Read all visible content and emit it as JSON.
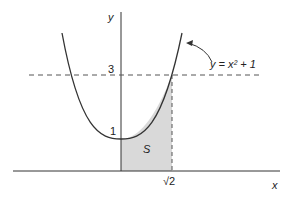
{
  "figure": {
    "curve_label": "y = x² + 1",
    "axis_x_label": "x",
    "axis_y_label": "y",
    "tick_y_3": "3",
    "tick_y_1": "1",
    "tick_x_sqrt2": "√2",
    "region_label": "S",
    "colors": {
      "line": "#333333",
      "shade": "#d9d9d9"
    }
  }
}
